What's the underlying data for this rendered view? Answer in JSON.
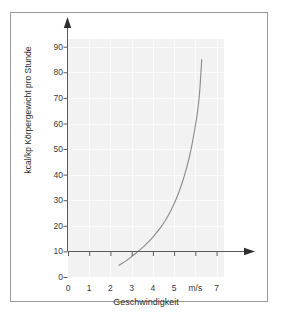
{
  "chart_data": {
    "type": "line",
    "title": "",
    "xlabel": "Geschwindigkeit",
    "ylabel": "kcal/kp Körpergewicht pro Stunde",
    "x_unit": "m/s",
    "xlim": [
      0,
      7.35
    ],
    "ylim": [
      0,
      93
    ],
    "xticks": [
      0,
      1,
      2,
      3,
      4,
      5,
      6,
      7
    ],
    "xtick_labels": [
      "0",
      "1",
      "2",
      "3",
      "4",
      "5",
      "m/s",
      "7"
    ],
    "yticks": [
      0,
      10,
      20,
      30,
      40,
      50,
      60,
      70,
      80,
      90
    ],
    "ytick_labels": [
      "0",
      "10",
      "20",
      "30",
      "40",
      "50",
      "60",
      "70",
      "80",
      "90"
    ],
    "grid": true,
    "legend": "none",
    "series": [
      {
        "name": "Energieverbrauch",
        "color": "#8a8a8a",
        "x": [
          2.4,
          2.6,
          2.8,
          3.0,
          3.2,
          3.4,
          3.6,
          3.8,
          4.0,
          4.2,
          4.4,
          4.6,
          4.8,
          5.0,
          5.2,
          5.4,
          5.6,
          5.8,
          6.0,
          6.1,
          6.2,
          6.3
        ],
        "y": [
          4.6,
          5.6,
          6.7,
          8.0,
          9.3,
          10.7,
          12.2,
          13.8,
          15.6,
          17.6,
          19.8,
          22.3,
          25.2,
          28.6,
          32.6,
          37.3,
          43.0,
          50.0,
          59.0,
          64.5,
          72.0,
          85.0
        ]
      }
    ]
  },
  "axes": {
    "y_arrow": "up-arrow-icon",
    "x_arrow": "right-arrow-icon"
  }
}
